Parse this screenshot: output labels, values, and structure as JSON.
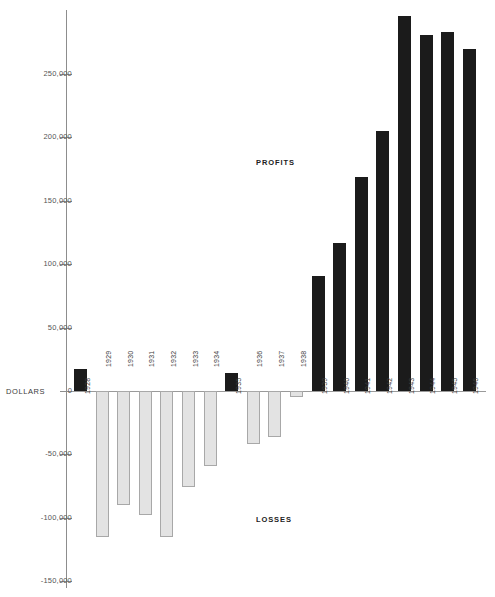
{
  "chart_data": {
    "type": "bar",
    "title": "",
    "subtitle": "",
    "xlabel": "",
    "ylabel": "DOLLARS",
    "ylim": [
      -150000,
      300000
    ],
    "grid": false,
    "legend_position": "none",
    "categories": [
      "1928",
      "1929",
      "1930",
      "1931",
      "1932",
      "1933",
      "1934",
      "1935",
      "1936",
      "1937",
      "1938",
      "1939",
      "1940",
      "1941",
      "1942",
      "1943",
      "1944",
      "1945",
      "1946"
    ],
    "values": [
      17000,
      -115000,
      -90000,
      -98000,
      -115000,
      -76000,
      -59000,
      14000,
      -42000,
      -36000,
      -5000,
      91000,
      117000,
      169000,
      205000,
      296000,
      281000,
      283000,
      270000
    ],
    "ytick_labels": [
      "250,000",
      "200,000",
      "150,000",
      "100,000",
      "50,000",
      "0",
      "-50,000",
      "-100,000",
      "-150,000"
    ],
    "ytick_values": [
      250000,
      200000,
      150000,
      100000,
      50000,
      0,
      -50000,
      -100000,
      -150000
    ],
    "annotations": [
      {
        "name": "profits",
        "text": "PROFITS"
      },
      {
        "name": "losses",
        "text": "LOSSES"
      }
    ],
    "series_colors": {
      "profit": "#1b1b1b",
      "loss_fill": "#e3e3e3",
      "loss_stroke": "#a8a8a8",
      "axis": "#8d8d8d",
      "text": "#3c3c3c"
    }
  }
}
